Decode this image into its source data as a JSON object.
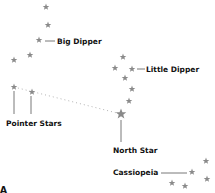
{
  "diagram": {
    "star_color": "#8a8a8a",
    "label_color": "#111111",
    "corner_label": "A",
    "labels": {
      "big_dipper": "Big Dipper",
      "little_dipper": "Little Dipper",
      "pointer_stars": "Pointer Stars",
      "north_star": "North Star",
      "cassiopeia": "Cassiopeia"
    },
    "constellations": [
      {
        "name": "Big Dipper",
        "stars": [
          [
            46,
            7
          ],
          [
            48,
            25
          ],
          [
            39,
            40
          ],
          [
            30,
            55
          ],
          [
            14,
            60
          ],
          [
            14,
            87
          ],
          [
            32,
            92
          ]
        ]
      },
      {
        "name": "Little Dipper",
        "stars": [
          [
            123,
            57
          ],
          [
            115,
            68
          ],
          [
            132,
            69
          ],
          [
            125,
            78
          ],
          [
            132,
            89
          ],
          [
            129,
            101
          ],
          [
            121,
            114
          ]
        ]
      },
      {
        "name": "Cassiopeia",
        "stars": [
          [
            206,
            161
          ],
          [
            192,
            172
          ],
          [
            207,
            179
          ],
          [
            172,
            183
          ],
          [
            185,
            186
          ]
        ]
      }
    ],
    "pointer_line": {
      "from": [
        14,
        87
      ],
      "to": [
        121,
        114
      ],
      "style": "dotted"
    }
  }
}
